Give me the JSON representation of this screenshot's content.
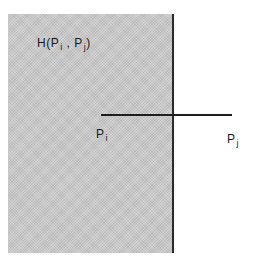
{
  "diagram": {
    "halfspace_label": {
      "prefix": "H(",
      "p1": "P",
      "p1_sub": "i",
      "sep": " , ",
      "p2": "P",
      "p2_sub": "j",
      "suffix": ")"
    },
    "point_i": {
      "base": "P",
      "sub": "i"
    },
    "point_j": {
      "base": "P",
      "sub": "j"
    },
    "colors": {
      "halfspace_fill": "#c9c9c9",
      "lines": "#1e1e1e",
      "background": "#ffffff"
    }
  }
}
